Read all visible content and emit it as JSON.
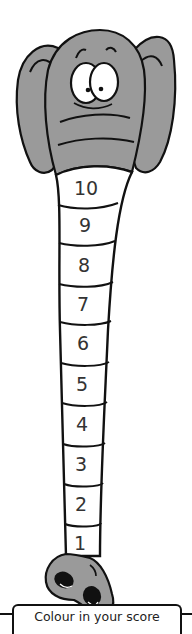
{
  "figure": {
    "colors": {
      "elephant_fill": "#9a9a9a",
      "outline": "#111111",
      "segment_fill": "#ffffff",
      "text": "#333333"
    }
  },
  "trunk": {
    "segments": [
      {
        "label": "10"
      },
      {
        "label": "9"
      },
      {
        "label": "8"
      },
      {
        "label": "7"
      },
      {
        "label": "6"
      },
      {
        "label": "5"
      },
      {
        "label": "4"
      },
      {
        "label": "3"
      },
      {
        "label": "2"
      },
      {
        "label": "1"
      }
    ]
  },
  "caption": {
    "text": "Colour in your score"
  }
}
